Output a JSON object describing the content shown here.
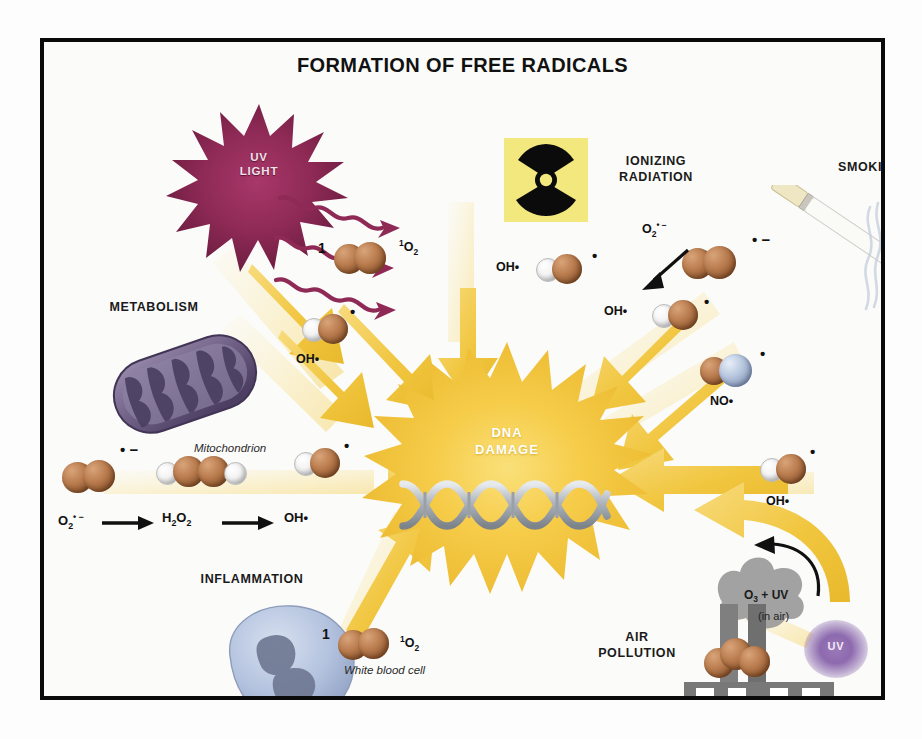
{
  "title": "FORMATION OF FREE RADICALS",
  "center": {
    "label_line1": "DNA",
    "label_line2": "DAMAGE",
    "icon": "dna-double-helix"
  },
  "sources": [
    {
      "id": "uv-light",
      "label": "UV\nLIGHT",
      "label_line1": "UV",
      "label_line2": "LIGHT",
      "icon": "uv-burst-star",
      "color": "#8e2a55"
    },
    {
      "id": "ionizing-radiation",
      "label": "IONIZING RADIATION",
      "label_line1": "IONIZING",
      "label_line2": "RADIATION",
      "icon": "radiation-trefoil",
      "color": "#f2e87e"
    },
    {
      "id": "smoking",
      "label": "SMOKING",
      "label_line1": "SMOKING",
      "label_line2": "",
      "icon": "cigarette",
      "color": "#f3f1e6"
    },
    {
      "id": "metabolism",
      "label": "METABOLISM",
      "label_line1": "METABOLISM",
      "label_line2": "",
      "icon": "mitochondrion",
      "color": "#6f5f85"
    },
    {
      "id": "inflammation",
      "label": "INFLAMMATION",
      "label_line1": "INFLAMMATION",
      "label_line2": "",
      "icon": "white-blood-cell",
      "color": "#aebedd"
    },
    {
      "id": "air-pollution",
      "label": "AIR POLLUTION",
      "label_line1": "AIR",
      "label_line2": "POLLUTION",
      "icon": "factory-smokestack",
      "color": "#8a8a8a"
    }
  ],
  "captions": {
    "mitochondrion": "Mitochondrion",
    "white_blood_cell": "White blood cell"
  },
  "species": {
    "singlet_oxygen_prefix": "1",
    "singlet_oxygen": "¹O₂",
    "hydroxyl": "OH•",
    "superoxide": "O₂• −",
    "nitric_oxide": "NO•",
    "radical_dot": "•",
    "radical_minus": "−"
  },
  "reaction_chain": {
    "step1": "O₂• −",
    "arrow1": "→",
    "step2": "H₂O₂",
    "arrow2": "→",
    "step3": "OH•"
  },
  "air_reaction": {
    "equation": "O₃ + UV",
    "note": "(in air)",
    "uv_blob_label": "UV"
  },
  "labels": {
    "uv_oh": "OH•",
    "rad_oh": "OH•",
    "smoke_oh": "OH•",
    "pollution_oh": "OH•",
    "metabolism_oh": "OH•"
  },
  "colors": {
    "frame": "#0a0a0a",
    "background": "#fbfbfa",
    "arrow_yellow": "#f0c63f",
    "burst_yellow": "#f5cc47",
    "uv_magenta": "#8e2a55",
    "radiation_yellow": "#f2e87e",
    "oxygen_brown": "#b97c4e",
    "hydrogen_white": "#f3f3f3",
    "nitrogen_blue": "#b7c6de",
    "mito_purple": "#6f5f85",
    "wbc_blue": "#aebedd",
    "factory_grey": "#8a8a8a",
    "uv_blob_purple": "#8d6aae",
    "dna_silver": "#b7bcc2"
  }
}
